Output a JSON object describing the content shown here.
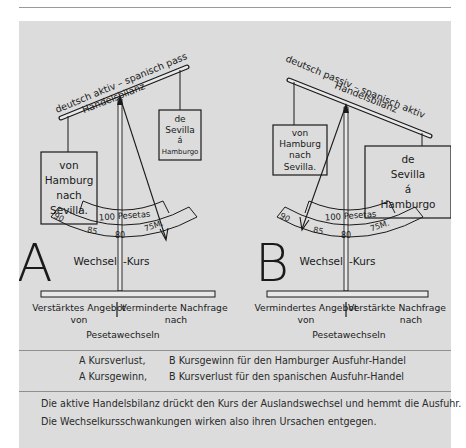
{
  "running_head": {
    "title": "Der Zahlmarkt",
    "page_number": "203"
  },
  "figure": {
    "diagram_a": {
      "letter": "A",
      "beam_label_top": "deutsch aktiv – spanisch passiv",
      "beam_label_bottom": "Handelsbilanz",
      "left_box": [
        "von",
        "Hamburg",
        "nach",
        "Sevilla."
      ],
      "right_box": [
        "de",
        "Sevilla",
        "á",
        "Hamburgo"
      ],
      "gauge_label": "100 Pesetas",
      "gauge_ticks": [
        "90",
        "85",
        "80",
        "75M."
      ],
      "post_label_left": "Wechsel",
      "post_label_right": "-Kurs",
      "base_left_line1": "Verstärktes Angebot",
      "base_left_line2": "von",
      "base_right_line1": "Verminderte Nachfrage",
      "base_right_line2": "nach",
      "base_bottom": "Pesetawechseln"
    },
    "diagram_b": {
      "letter": "B",
      "beam_label_top": "deutsch passiv – spanisch aktiv",
      "beam_label_bottom": "Handelsbilanz",
      "left_box": [
        "von",
        "Hamburg",
        "nach",
        "Sevilla."
      ],
      "right_box": [
        "de",
        "Sevilla",
        "á",
        "Hamburgo"
      ],
      "gauge_label": "100 Pesetas",
      "gauge_ticks": [
        "90",
        "85",
        "80",
        "75M."
      ],
      "post_label_left": "Wechsel",
      "post_label_right": "-Kurs",
      "base_left_line1": "Vermindertes Angebot",
      "base_left_line2": "von",
      "base_right_line1": "Verstärkte Nachfrage",
      "base_right_line2": "nach",
      "base_bottom": "Pesetawechseln"
    }
  },
  "legend": [
    {
      "a": "A Kursverlust,",
      "b": "B Kursgewinn für den Hamburger Ausfuhr-Handel"
    },
    {
      "a": "A Kursgewinn,",
      "b": "B Kursverlust für den spanischen Ausfuhr-Handel"
    }
  ],
  "summary": [
    "Die aktive Handelsbilanz drückt den Kurs der Auslandswechsel und hemmt die Ausfuhr.",
    "Die Wechselkursschwankungen wirken also ihren Ursachen entgegen."
  ],
  "colors": {
    "panel": "#dcdcdc",
    "ink": "#1a1a1a",
    "rule": "#8f8f8f"
  }
}
